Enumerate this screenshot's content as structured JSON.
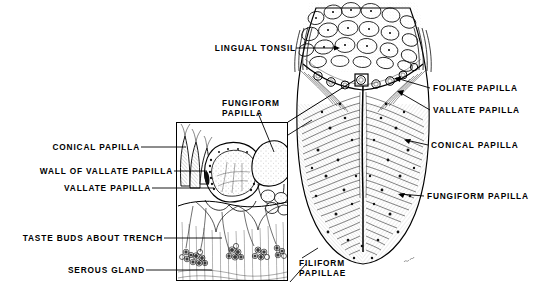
{
  "plate": {
    "title": "Papillae of the Tongue",
    "background_color": "#ffffff",
    "ink_color": "#000000",
    "width": 543,
    "height": 292
  },
  "labels": {
    "lingual_tonsil": "LINGUAL TONSIL",
    "fungiform_papilla_top_line1": "FUNGIFORM",
    "fungiform_papilla_top_line2": "PAPILLA",
    "conical_papilla_left": "CONICAL PAPILLA",
    "wall_of_vallate_papilla": "WALL OF VALLATE PAPILLA",
    "vallate_papilla_left": "VALLATE PAPILLA",
    "taste_buds_about_trench": "TASTE BUDS ABOUT TRENCH",
    "serous_gland": "SEROUS GLAND",
    "foliate_papilla": "FOLIATE PAPILLA",
    "vallate_papilla_right": "VALLATE PAPILLA",
    "conical_papilla_right": "CONICAL PAPILLA",
    "fungiform_papilla_right": "FUNGIFORM PAPILLA",
    "filiform_papillae_line1": "FILIFORM",
    "filiform_papillae_line2": "PAPILLAE"
  },
  "figures": {
    "inset": {
      "name": "magnified-section-of-vallate-papilla",
      "x": 176,
      "y": 122,
      "width": 112,
      "height": 159
    },
    "tongue": {
      "name": "dorsum-of-tongue",
      "x": 293,
      "y": 0,
      "width": 140,
      "height": 285
    },
    "callout_marker": {
      "name": "magnification-source-square",
      "x": 355,
      "y": 74,
      "width": 13,
      "height": 12
    }
  }
}
